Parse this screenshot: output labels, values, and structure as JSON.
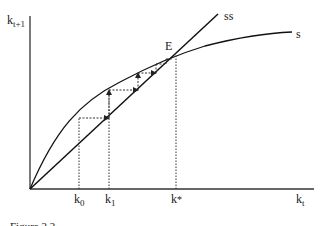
{
  "diagram": {
    "type": "cobweb-convergence",
    "axes": {
      "y_label_main": "k",
      "y_label_sub": "t+1",
      "x_label_main": "k",
      "x_label_sub": "t"
    },
    "curves": {
      "ss_label": "ss",
      "s_label": "s"
    },
    "equilibrium_label": "E",
    "x_ticks": [
      {
        "main": "k",
        "sub": "0"
      },
      {
        "main": "k",
        "sub": "1"
      },
      {
        "main": "k",
        "sup": "*"
      }
    ],
    "caption": "Figure 3.3"
  },
  "colors": {
    "line": "#222222",
    "background": "#ffffff"
  }
}
